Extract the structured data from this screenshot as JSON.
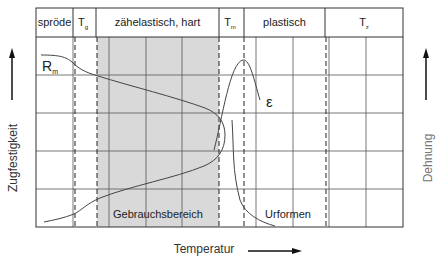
{
  "diagram": {
    "header": {
      "columns": [
        {
          "id": "sproede",
          "label": "spröde"
        },
        {
          "id": "tg",
          "label": "T",
          "subscript": "g"
        },
        {
          "id": "zaehelastisch",
          "label": "zähelastisch, hart"
        },
        {
          "id": "tm",
          "label": "T",
          "subscript": "m"
        },
        {
          "id": "plastisch",
          "label": "plastisch"
        },
        {
          "id": "tz",
          "label": "T",
          "subscript": "z"
        }
      ]
    },
    "curves": {
      "strength": {
        "label": "R",
        "subscript": "m"
      },
      "elongation": {
        "label": "ε"
      }
    },
    "regions": {
      "usage": {
        "label": "Gebrauchsbereich",
        "fill": "#d9d9d9"
      },
      "forming": {
        "label": "Urformen"
      }
    },
    "axes": {
      "left": {
        "label": "Zugfestigkeit"
      },
      "right": {
        "label": "Dehnung"
      },
      "bottom": {
        "label": "Temperatur"
      }
    },
    "colors": {
      "frame": "#333333",
      "grid": "#555555",
      "shade": "#d9d9d9",
      "curve": "#444444",
      "right_label": "#777777"
    }
  }
}
